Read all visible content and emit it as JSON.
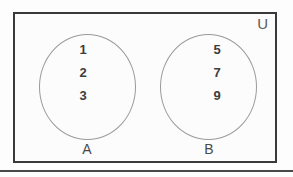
{
  "figure": {
    "type": "venn-diagram",
    "universe": {
      "label": "U",
      "border_color": "#3a3a3a",
      "background_color": "#fcfcfc"
    },
    "sets": [
      {
        "label": "A",
        "elements": [
          "1",
          "2",
          "3"
        ],
        "circle_color": "#9a9a9a"
      },
      {
        "label": "B",
        "elements": [
          "5",
          "7",
          "9"
        ],
        "circle_color": "#9a9a9a"
      }
    ],
    "relationship": "disjoint",
    "rule_color": "#4a4a4a"
  }
}
